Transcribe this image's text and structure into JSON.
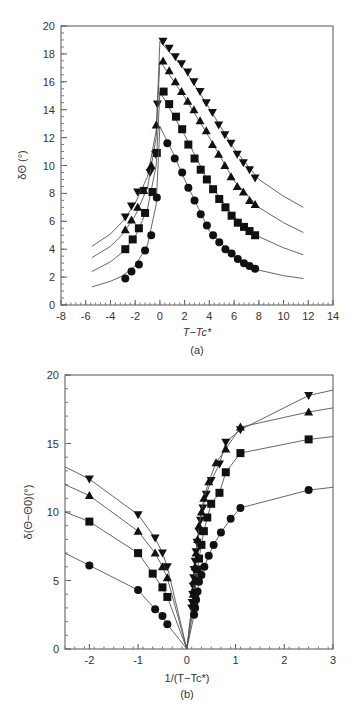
{
  "chart_data": [
    {
      "id": "a",
      "type": "scatter",
      "panel_label": "(a)",
      "title": "",
      "xlabel": "T−Tc*",
      "ylabel": "δΘ (°)",
      "xlim": [
        -8,
        14
      ],
      "ylim": [
        0,
        20
      ],
      "xticks": [
        -8,
        -6,
        -4,
        -2,
        0,
        2,
        4,
        6,
        8,
        10,
        12,
        14
      ],
      "yticks": [
        0,
        2,
        4,
        6,
        8,
        10,
        12,
        14,
        16,
        18,
        20
      ],
      "grid": false,
      "legend": "none",
      "series": [
        {
          "name": "down-triangle",
          "marker": "triangle-down",
          "points": [
            [
              -2.8,
              6.3
            ],
            [
              -2.3,
              7.1
            ],
            [
              -1.8,
              8.1
            ],
            [
              -1.3,
              8.2
            ],
            [
              -0.8,
              9.5
            ],
            [
              -0.35,
              10.8
            ],
            [
              -0.2,
              14.4
            ],
            [
              0.25,
              18.9
            ],
            [
              0.75,
              18.4
            ],
            [
              1.25,
              17.8
            ],
            [
              1.75,
              17.3
            ],
            [
              2.25,
              16.7
            ],
            [
              2.75,
              16.0
            ],
            [
              3.25,
              15.3
            ],
            [
              3.75,
              14.5
            ],
            [
              4.25,
              13.8
            ],
            [
              4.75,
              12.9
            ],
            [
              5.25,
              12.2
            ],
            [
              5.75,
              11.6
            ],
            [
              6.25,
              10.8
            ],
            [
              6.75,
              10.2
            ],
            [
              7.25,
              9.7
            ],
            [
              7.7,
              9.1
            ]
          ],
          "fit_curve": [
            [
              -5.5,
              4.2
            ],
            [
              -4,
              5.1
            ],
            [
              -3,
              6.0
            ],
            [
              -2,
              7.3
            ],
            [
              -1,
              9.2
            ],
            [
              -0.3,
              12.5
            ],
            [
              0,
              18.9
            ],
            [
              2,
              16.9
            ],
            [
              4,
              14.1
            ],
            [
              6,
              11.2
            ],
            [
              8,
              9.0
            ],
            [
              10,
              7.8
            ],
            [
              11.6,
              7.0
            ]
          ]
        },
        {
          "name": "up-triangle",
          "marker": "triangle-up",
          "points": [
            [
              -2.8,
              5.4
            ],
            [
              -2.3,
              6.1
            ],
            [
              -1.8,
              7.0
            ],
            [
              -1.3,
              8.2
            ],
            [
              -0.7,
              10.0
            ],
            [
              -0.3,
              12.9
            ],
            [
              0.25,
              17.5
            ],
            [
              0.75,
              16.8
            ],
            [
              1.25,
              16.0
            ],
            [
              1.75,
              15.3
            ],
            [
              2.25,
              14.6
            ],
            [
              2.75,
              14.0
            ],
            [
              3.25,
              13.2
            ],
            [
              3.75,
              12.5
            ],
            [
              4.25,
              11.5
            ],
            [
              4.75,
              10.8
            ],
            [
              5.25,
              10.0
            ],
            [
              5.75,
              9.2
            ],
            [
              6.25,
              8.5
            ],
            [
              6.75,
              8.1
            ],
            [
              7.25,
              7.5
            ],
            [
              7.7,
              7.2
            ]
          ],
          "fit_curve": [
            [
              -5.5,
              3.4
            ],
            [
              -4,
              4.2
            ],
            [
              -3,
              5.1
            ],
            [
              -2,
              6.4
            ],
            [
              -1,
              8.4
            ],
            [
              -0.3,
              12.0
            ],
            [
              0,
              17.5
            ],
            [
              2,
              14.9
            ],
            [
              4,
              12.0
            ],
            [
              6,
              8.9
            ],
            [
              8,
              7.0
            ],
            [
              10,
              5.9
            ],
            [
              11.6,
              5.2
            ]
          ]
        },
        {
          "name": "square",
          "marker": "square",
          "points": [
            [
              -2.8,
              4.0
            ],
            [
              -2.2,
              4.7
            ],
            [
              -1.7,
              5.5
            ],
            [
              -1.2,
              6.6
            ],
            [
              -0.6,
              8.1
            ],
            [
              -0.25,
              10.9
            ],
            [
              0.3,
              15.3
            ],
            [
              0.75,
              14.4
            ],
            [
              1.3,
              13.5
            ],
            [
              1.8,
              12.6
            ],
            [
              2.3,
              11.5
            ],
            [
              2.8,
              10.5
            ],
            [
              3.3,
              9.7
            ],
            [
              3.8,
              9.0
            ],
            [
              4.3,
              8.3
            ],
            [
              4.8,
              7.6
            ],
            [
              5.3,
              7.0
            ],
            [
              5.8,
              6.4
            ],
            [
              6.3,
              5.9
            ],
            [
              6.8,
              5.6
            ],
            [
              7.25,
              5.3
            ],
            [
              7.7,
              5.0
            ]
          ],
          "fit_curve": [
            [
              -5.5,
              2.4
            ],
            [
              -4,
              3.1
            ],
            [
              -3,
              3.8
            ],
            [
              -2,
              4.9
            ],
            [
              -1,
              6.9
            ],
            [
              -0.3,
              10.0
            ],
            [
              0,
              15.3
            ],
            [
              2,
              12.2
            ],
            [
              4,
              8.7
            ],
            [
              6,
              6.3
            ],
            [
              8,
              4.9
            ],
            [
              10,
              4.1
            ],
            [
              11.6,
              3.6
            ]
          ]
        },
        {
          "name": "circle",
          "marker": "circle",
          "points": [
            [
              -2.8,
              1.9
            ],
            [
              -2.3,
              2.4
            ],
            [
              -1.7,
              2.9
            ],
            [
              -1.2,
              3.9
            ],
            [
              -0.7,
              5.0
            ],
            [
              -0.25,
              7.7
            ],
            [
              0.6,
              11.6
            ],
            [
              1.2,
              10.5
            ],
            [
              1.8,
              9.5
            ],
            [
              2.3,
              8.4
            ],
            [
              2.8,
              7.5
            ],
            [
              3.3,
              6.5
            ],
            [
              3.8,
              5.7
            ],
            [
              4.3,
              5.0
            ],
            [
              4.8,
              4.5
            ],
            [
              5.3,
              4.0
            ],
            [
              5.8,
              3.7
            ],
            [
              6.3,
              3.3
            ],
            [
              6.8,
              3.0
            ],
            [
              7.25,
              2.8
            ],
            [
              7.7,
              2.6
            ]
          ],
          "fit_curve": [
            [
              -5.5,
              1.3
            ],
            [
              -4,
              1.7
            ],
            [
              -3,
              2.1
            ],
            [
              -2,
              2.8
            ],
            [
              -1,
              4.3
            ],
            [
              -0.3,
              7.2
            ],
            [
              0,
              12.8
            ],
            [
              1,
              11.0
            ],
            [
              2,
              9.0
            ],
            [
              4,
              5.3
            ],
            [
              6,
              3.5
            ],
            [
              8,
              2.5
            ],
            [
              10,
              2.1
            ],
            [
              11.6,
              1.9
            ]
          ]
        }
      ]
    },
    {
      "id": "b",
      "type": "line",
      "panel_label": "(b)",
      "title": "",
      "xlabel": "1/(T−Tc*)",
      "ylabel": "δ(Θ−Θ0)(°)",
      "xlim": [
        -2.5,
        3
      ],
      "ylim": [
        0,
        20
      ],
      "xticks": [
        -2,
        -1,
        0,
        1,
        2,
        3
      ],
      "yticks": [
        0,
        5,
        10,
        15,
        20
      ],
      "grid": false,
      "legend": "none",
      "series": [
        {
          "name": "down-triangle",
          "marker": "triangle-down",
          "points": [
            [
              -2.0,
              12.4
            ],
            [
              -1.0,
              9.8
            ],
            [
              -0.65,
              8.1
            ],
            [
              -0.5,
              7.0
            ],
            [
              -0.4,
              6.0
            ],
            [
              0.1,
              3.0
            ],
            [
              0.11,
              3.4
            ],
            [
              0.12,
              4.0
            ],
            [
              0.13,
              4.6
            ],
            [
              0.14,
              5.2
            ],
            [
              0.15,
              5.8
            ],
            [
              0.17,
              6.4
            ],
            [
              0.19,
              7.1
            ],
            [
              0.21,
              7.8
            ],
            [
              0.25,
              8.6
            ],
            [
              0.28,
              9.4
            ],
            [
              0.33,
              10.3
            ],
            [
              0.4,
              11.3
            ],
            [
              0.5,
              12.3
            ],
            [
              0.67,
              13.5
            ],
            [
              0.8,
              15.1
            ],
            [
              1.1,
              16.0
            ],
            [
              2.5,
              18.5
            ]
          ],
          "line_extent": [
            [
              -2.5,
              13.3
            ],
            [
              0,
              0
            ],
            [
              3,
              18.9
            ]
          ]
        },
        {
          "name": "up-triangle",
          "marker": "triangle-up",
          "points": [
            [
              -2.0,
              11.2
            ],
            [
              -1.0,
              8.6
            ],
            [
              -0.65,
              7.0
            ],
            [
              -0.5,
              6.0
            ],
            [
              -0.4,
              5.2
            ],
            [
              0.13,
              4.0
            ],
            [
              0.15,
              5.0
            ],
            [
              0.17,
              6.0
            ],
            [
              0.19,
              7.0
            ],
            [
              0.22,
              8.0
            ],
            [
              0.25,
              9.0
            ],
            [
              0.3,
              10.0
            ],
            [
              0.35,
              11.0
            ],
            [
              0.45,
              12.2
            ],
            [
              0.6,
              13.6
            ],
            [
              0.8,
              14.6
            ],
            [
              1.1,
              16.2
            ],
            [
              2.5,
              17.3
            ]
          ],
          "line_extent": [
            [
              -2.5,
              12.0
            ],
            [
              0,
              0
            ],
            [
              3,
              17.6
            ]
          ]
        },
        {
          "name": "square",
          "marker": "square",
          "points": [
            [
              -2.0,
              9.3
            ],
            [
              -1.0,
              7.0
            ],
            [
              -0.7,
              5.5
            ],
            [
              -0.5,
              4.5
            ],
            [
              -0.4,
              3.8
            ],
            [
              0.15,
              3.3
            ],
            [
              0.17,
              4.1
            ],
            [
              0.19,
              5.0
            ],
            [
              0.22,
              5.8
            ],
            [
              0.25,
              6.6
            ],
            [
              0.3,
              7.6
            ],
            [
              0.35,
              8.6
            ],
            [
              0.42,
              9.6
            ],
            [
              0.5,
              10.6
            ],
            [
              0.67,
              11.4
            ],
            [
              0.8,
              12.9
            ],
            [
              1.1,
              14.3
            ],
            [
              2.5,
              15.3
            ]
          ],
          "line_extent": [
            [
              -2.5,
              10.0
            ],
            [
              0,
              0
            ],
            [
              3,
              15.5
            ]
          ]
        },
        {
          "name": "circle",
          "marker": "circle",
          "points": [
            [
              -2.0,
              6.1
            ],
            [
              -1.0,
              4.3
            ],
            [
              -0.65,
              2.9
            ],
            [
              -0.5,
              2.4
            ],
            [
              -0.4,
              1.8
            ],
            [
              0.15,
              2.5
            ],
            [
              0.17,
              3.0
            ],
            [
              0.19,
              3.6
            ],
            [
              0.22,
              4.2
            ],
            [
              0.25,
              4.9
            ],
            [
              0.3,
              5.4
            ],
            [
              0.36,
              6.0
            ],
            [
              0.45,
              6.8
            ],
            [
              0.55,
              7.6
            ],
            [
              0.7,
              8.5
            ],
            [
              0.9,
              9.5
            ],
            [
              1.1,
              10.3
            ],
            [
              2.5,
              11.6
            ]
          ],
          "line_extent": [
            [
              -2.5,
              7.0
            ],
            [
              0,
              0
            ],
            [
              3,
              11.8
            ]
          ]
        }
      ]
    }
  ]
}
